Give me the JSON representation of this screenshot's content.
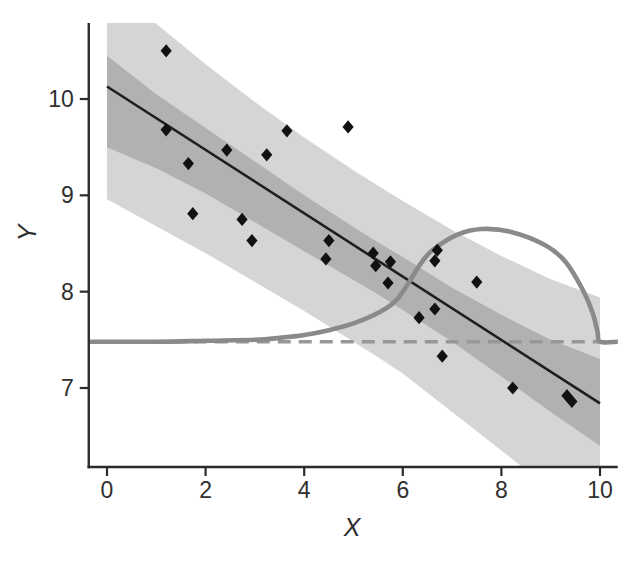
{
  "chart_data": {
    "type": "scatter",
    "title": "",
    "xlabel": "X",
    "ylabel": "Y",
    "x_ticks": [
      0,
      2,
      4,
      6,
      8,
      10
    ],
    "y_ticks": [
      7,
      8,
      9,
      10
    ],
    "xlim": [
      -0.37,
      10.36
    ],
    "ylim": [
      6.18,
      10.79
    ],
    "grid": false,
    "legend": false,
    "points": [
      [
        1.2,
        10.5
      ],
      [
        1.2,
        9.68
      ],
      [
        1.65,
        9.33
      ],
      [
        1.74,
        8.81
      ],
      [
        2.43,
        9.47
      ],
      [
        2.74,
        8.75
      ],
      [
        2.94,
        8.53
      ],
      [
        3.24,
        9.42
      ],
      [
        3.65,
        9.67
      ],
      [
        4.44,
        8.34
      ],
      [
        4.5,
        8.53
      ],
      [
        4.89,
        9.71
      ],
      [
        5.4,
        8.4
      ],
      [
        5.45,
        8.27
      ],
      [
        5.7,
        8.09
      ],
      [
        5.75,
        8.31
      ],
      [
        6.33,
        7.73
      ],
      [
        6.65,
        7.82
      ],
      [
        6.65,
        8.32
      ],
      [
        6.7,
        8.43
      ],
      [
        6.8,
        7.33
      ],
      [
        7.5,
        8.1
      ],
      [
        8.23,
        7.0
      ],
      [
        9.33,
        6.92
      ],
      [
        9.43,
        6.86
      ]
    ],
    "regression_line": {
      "x": [
        0,
        10
      ],
      "y": [
        10.13,
        6.84
      ]
    },
    "confidence_band_inner": {
      "x": [
        0,
        1,
        2,
        3,
        4,
        5,
        5.5,
        6,
        7,
        8,
        9,
        10
      ],
      "upper": [
        10.45,
        10.05,
        9.7,
        9.35,
        9.0,
        8.67,
        8.51,
        8.36,
        8.04,
        7.76,
        7.5,
        7.3
      ],
      "lower": [
        9.5,
        9.28,
        9.02,
        8.72,
        8.42,
        8.12,
        7.97,
        7.81,
        7.48,
        7.12,
        6.75,
        6.4
      ]
    },
    "prediction_band_outer": {
      "x": [
        0,
        1,
        2,
        3,
        4,
        5,
        5.5,
        6,
        7,
        8,
        9,
        10
      ],
      "upper": [
        11.2,
        10.78,
        10.36,
        9.97,
        9.6,
        9.26,
        9.1,
        8.94,
        8.64,
        8.37,
        8.13,
        7.94
      ],
      "lower": [
        8.96,
        8.68,
        8.4,
        8.1,
        7.8,
        7.48,
        7.32,
        7.15,
        6.75,
        6.35,
        5.95,
        5.55
      ]
    },
    "density_curve": {
      "x": [
        -0.37,
        1,
        2,
        3,
        3.5,
        4,
        4.5,
        5,
        5.5,
        5.9,
        6.35,
        6.6,
        7.1,
        7.6,
        8.2,
        8.9,
        9.3,
        9.65,
        9.85,
        9.95,
        10,
        10.36
      ],
      "y": [
        7.48,
        7.48,
        7.49,
        7.5,
        7.52,
        7.55,
        7.6,
        7.67,
        7.78,
        7.93,
        8.28,
        8.43,
        8.59,
        8.65,
        8.62,
        8.48,
        8.31,
        8.02,
        7.78,
        7.58,
        7.48,
        7.48
      ]
    },
    "reference_line_y": 7.48,
    "colors": {
      "outer_band": "#d4d5d4",
      "inner_band": "#b0b1b0",
      "regression_line": "#1e1e1e",
      "points": "#111111",
      "density_curve": "#8a8a8a",
      "reference_dashed": "#989898",
      "axis": "#2b2b2b",
      "tick_text": "#2f2f2f"
    }
  }
}
